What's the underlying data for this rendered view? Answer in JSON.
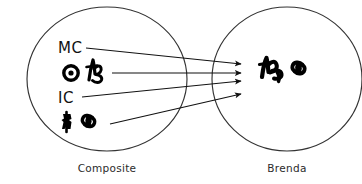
{
  "diagram": {
    "type": "mapping-diagram",
    "title": "",
    "canvas": {
      "width": 362,
      "height": 184,
      "background": "#ffffff"
    },
    "ink_color": "#111111",
    "outline_color": "#333333"
  },
  "sets": {
    "source": {
      "caption": "Composite",
      "caption_x": 107,
      "caption_y": 170,
      "shape": "ellipse",
      "cx": 107,
      "cy": 79,
      "rx": 80,
      "ry": 72
    },
    "target": {
      "caption": "Brenda",
      "caption_x": 287,
      "caption_y": 170,
      "shape": "ellipse",
      "cx": 287,
      "cy": 79,
      "rx": 75,
      "ry": 72
    }
  },
  "source_items": [
    {
      "id": "mc",
      "kind": "text",
      "label": "MC",
      "x": 58,
      "y": 52
    },
    {
      "id": "row-sample-1",
      "kind": "glyph-pair",
      "label": "",
      "x": 58,
      "y": 64
    },
    {
      "id": "ic",
      "kind": "text",
      "label": "IC",
      "x": 58,
      "y": 102
    },
    {
      "id": "row-sample-2",
      "kind": "glyph-pair",
      "label": "",
      "x": 58,
      "y": 112
    }
  ],
  "target_items": [
    {
      "id": "brenda-sample",
      "kind": "glyph-pair",
      "label": "",
      "x": 258,
      "y": 58
    }
  ],
  "arrows": [
    {
      "id": "arrow-mc",
      "from": "mc",
      "x1": 86,
      "y1": 48,
      "x2": 243,
      "y2": 64
    },
    {
      "id": "arrow-sample-1",
      "from": "row-sample-1",
      "x1": 112,
      "y1": 73,
      "x2": 243,
      "y2": 73
    },
    {
      "id": "arrow-ic",
      "from": "ic",
      "x1": 82,
      "y1": 97,
      "x2": 243,
      "y2": 81
    },
    {
      "id": "arrow-sample-2",
      "from": "row-sample-2",
      "x1": 110,
      "y1": 124,
      "x2": 243,
      "y2": 94
    }
  ],
  "arrow_count": 4
}
